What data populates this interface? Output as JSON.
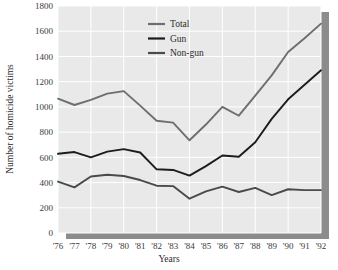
{
  "chart_data": {
    "type": "line",
    "title": "",
    "xlabel": "Years",
    "ylabel": "Number of homicide victims",
    "categories": [
      "'76",
      "'77",
      "'78",
      "'79",
      "'80",
      "'81",
      "'82",
      "'83",
      "'84",
      "'85",
      "'86",
      "'87",
      "'88",
      "'89",
      "'90",
      "'91",
      "'92"
    ],
    "x_tick_labels": [
      "'76",
      "'77",
      "'78",
      "'79",
      "'80",
      "'81",
      "'82",
      "'83",
      "'84",
      "'85",
      "'86",
      "'87",
      "'88",
      "'89",
      "'90",
      "'91",
      "'92"
    ],
    "y_tick_labels": [
      "0",
      "200",
      "400",
      "600",
      "800",
      "1000",
      "1200",
      "1400",
      "1600",
      "1800"
    ],
    "y_ticks": [
      0,
      200,
      400,
      600,
      800,
      1000,
      1200,
      1400,
      1600,
      1800
    ],
    "ylim": [
      0,
      1800
    ],
    "grid": true,
    "legend_position": "top-center",
    "series": [
      {
        "name": "Total",
        "color": "#6e6e6e",
        "values": [
          1065,
          1015,
          1055,
          1105,
          1125,
          1010,
          890,
          875,
          735,
          860,
          1000,
          930,
          1090,
          1250,
          1435,
          1545,
          1660
        ]
      },
      {
        "name": "Gun",
        "color": "#1c1c1c",
        "values": [
          628,
          642,
          600,
          645,
          665,
          638,
          505,
          500,
          455,
          530,
          615,
          605,
          720,
          905,
          1060,
          1175,
          1290
        ]
      },
      {
        "name": "Non-gun",
        "color": "#4a4a4a",
        "values": [
          408,
          362,
          448,
          462,
          452,
          420,
          375,
          372,
          272,
          330,
          368,
          325,
          358,
          300,
          347,
          340,
          340
        ]
      }
    ]
  },
  "legend": {
    "items": [
      {
        "label": "Total",
        "color": "#6e6e6e"
      },
      {
        "label": "Gun",
        "color": "#1c1c1c"
      },
      {
        "label": "Non-gun",
        "color": "#4a4a4a"
      }
    ]
  },
  "style": {
    "plot_background": "#e9e9e9",
    "gridline_color": "#ffffff",
    "shadow_color": "#8c8c8c",
    "page_background": "#ffffff",
    "text_color": "#2c2c2c"
  }
}
